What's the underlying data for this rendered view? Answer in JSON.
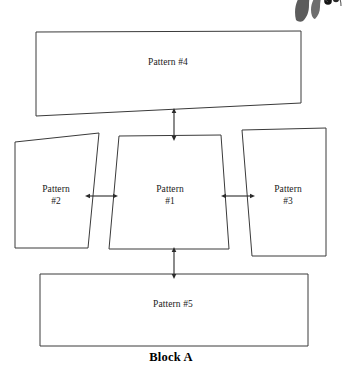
{
  "figure": {
    "caption": "Block A",
    "type": "block-diagram"
  },
  "colors": {
    "stroke": "#3a3a3a",
    "fill": "#ffffff",
    "text": "#1a1a1a",
    "caption_text": "#000000",
    "ornament_dark": "#4a4a4a",
    "ornament_berry": "#1c1c1c",
    "background": "#ffffff"
  },
  "nodes": [
    {
      "id": "pattern-4",
      "label": "Pattern #4",
      "shape": "quadrilateral",
      "points": "36,32 301,31 301,103 36,116",
      "label_x": 168,
      "label_y": 63
    },
    {
      "id": "pattern-2",
      "label": "Pattern\n#2",
      "shape": "quadrilateral",
      "points": "15,142 99,133 88,248 15,248",
      "label_x": 56,
      "label_y": 190
    },
    {
      "id": "pattern-1",
      "label": "Pattern\n#1",
      "shape": "quadrilateral",
      "points": "119,136 221,135 229,249 109,249",
      "label_x": 170,
      "label_y": 190
    },
    {
      "id": "pattern-3",
      "label": "Pattern\n#3",
      "shape": "quadrilateral",
      "points": "242,130 326,128 326,256 252,256",
      "label_x": 288,
      "label_y": 190
    },
    {
      "id": "pattern-5",
      "label": "Pattern #5",
      "shape": "quadrilateral",
      "points": "40,274 308,274 308,346 40,346",
      "label_x": 173,
      "label_y": 305
    }
  ],
  "connectors": [
    {
      "id": "connector-pattern4-pattern1",
      "orientation": "vertical",
      "arrowheads": "double",
      "from": "pattern-4",
      "to": "pattern-1",
      "x1": 174,
      "y1": 113,
      "x2": 174,
      "y2": 136
    },
    {
      "id": "connector-pattern2-pattern1",
      "orientation": "horizontal",
      "arrowheads": "double",
      "from": "pattern-2",
      "to": "pattern-1",
      "x1": 90,
      "y1": 196,
      "x2": 113,
      "y2": 196
    },
    {
      "id": "connector-pattern1-pattern3",
      "orientation": "horizontal",
      "arrowheads": "double",
      "from": "pattern-1",
      "to": "pattern-3",
      "x1": 226,
      "y1": 196,
      "x2": 250,
      "y2": 196
    },
    {
      "id": "connector-pattern1-pattern5",
      "orientation": "vertical",
      "arrowheads": "double",
      "from": "pattern-1",
      "to": "pattern-5",
      "x1": 174,
      "y1": 252,
      "x2": 174,
      "y2": 274
    }
  ],
  "ornament": {
    "id": "leaf-berry-ornament",
    "description": "partial leaf and berry illustration clipped at top-right corner"
  }
}
